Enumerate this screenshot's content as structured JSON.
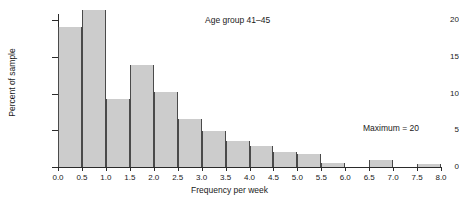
{
  "chart_data": {
    "type": "bar",
    "title": "Age group 41–45",
    "xlabel": "Frequency per week",
    "ylabel": "Percent of sample",
    "annotation": "Maximum = 20",
    "grid": false,
    "legend": null,
    "xlim": [
      0.0,
      8.0
    ],
    "ylim": [
      0,
      20
    ],
    "bin_width": 0.5,
    "xticks": [
      "0.0",
      "0.5",
      "1.0",
      "1.5",
      "2.0",
      "2.5",
      "3.0",
      "3.5",
      "4.0",
      "4.5",
      "5.0",
      "5.5",
      "6.0",
      "6.5",
      "7.0",
      "7.5",
      "8.0"
    ],
    "xtick_values": [
      0.0,
      0.5,
      1.0,
      1.5,
      2.0,
      2.5,
      3.0,
      3.5,
      4.0,
      4.5,
      5.0,
      5.5,
      6.0,
      6.5,
      7.0,
      7.5,
      8.0
    ],
    "yticks": [
      "0",
      "5",
      "10",
      "15",
      "20"
    ],
    "ytick_values": [
      0,
      5,
      10,
      15,
      20
    ],
    "bins": [
      {
        "start": 0.0,
        "end": 0.5,
        "label": "0.0–0.5",
        "value": 19.1
      },
      {
        "start": 0.5,
        "end": 1.0,
        "label": "0.5–1.0",
        "value": 21.3
      },
      {
        "start": 1.0,
        "end": 1.5,
        "label": "1.0–1.5",
        "value": 9.3
      },
      {
        "start": 1.5,
        "end": 2.0,
        "label": "1.5–2.0",
        "value": 13.9
      },
      {
        "start": 2.0,
        "end": 2.5,
        "label": "2.0–2.5",
        "value": 10.2
      },
      {
        "start": 2.5,
        "end": 3.0,
        "label": "2.5–3.0",
        "value": 6.5
      },
      {
        "start": 3.0,
        "end": 3.5,
        "label": "3.0–3.5",
        "value": 4.9
      },
      {
        "start": 3.5,
        "end": 4.0,
        "label": "3.5–4.0",
        "value": 3.6
      },
      {
        "start": 4.0,
        "end": 4.5,
        "label": "4.0–4.5",
        "value": 2.8
      },
      {
        "start": 4.5,
        "end": 5.0,
        "label": "4.5–5.0",
        "value": 2.0
      },
      {
        "start": 5.0,
        "end": 5.5,
        "label": "5.0–5.5",
        "value": 1.8
      },
      {
        "start": 5.5,
        "end": 6.0,
        "label": "5.5–6.0",
        "value": 0.5
      },
      {
        "start": 6.0,
        "end": 6.5,
        "label": "6.0–6.5",
        "value": 0.0
      },
      {
        "start": 6.5,
        "end": 7.0,
        "label": "6.5–7.0",
        "value": 0.9
      },
      {
        "start": 7.0,
        "end": 7.5,
        "label": "7.0–7.5",
        "value": 0.0
      },
      {
        "start": 7.5,
        "end": 8.0,
        "label": "7.5–8.0",
        "value": 0.4
      }
    ],
    "colors": {
      "bar_fill": "#cccccc",
      "bar_edge": "#4a4a4a",
      "axis": "#2b2b2b",
      "text": "#1a1a1a",
      "background": "#ffffff"
    }
  }
}
